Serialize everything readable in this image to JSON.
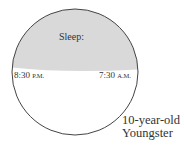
{
  "diagram": {
    "segment_label": "Sleep:",
    "start_time": {
      "time": "8:30",
      "suffix": "P.M."
    },
    "end_time": {
      "time": "7:30",
      "suffix": "A.M."
    },
    "caption_line1": "10-year-old",
    "caption_line2": "Youngster",
    "colors": {
      "sleep_fill": "#d9d9d9",
      "outline": "#444444",
      "background": "#ffffff"
    }
  }
}
